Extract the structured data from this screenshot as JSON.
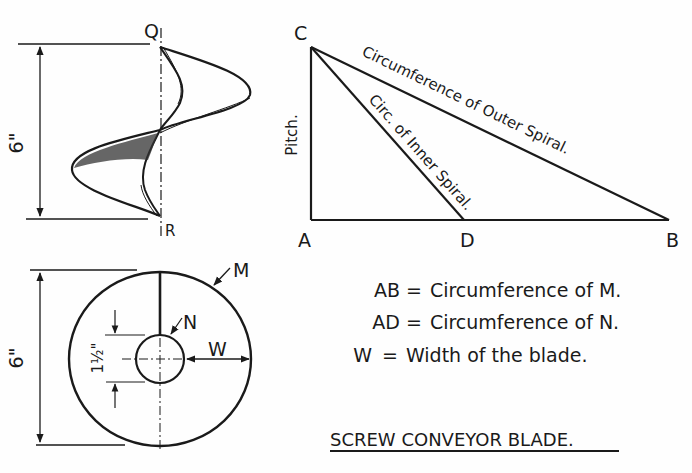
{
  "side_view": {
    "top_point": "Q",
    "bottom_point": "R",
    "height_dim": "6\""
  },
  "triangle": {
    "vertices": {
      "C": "C",
      "A": "A",
      "D": "D",
      "B": "B"
    },
    "side_label": "Pitch.",
    "hypotenuse_outer": "Circumference of Outer Spiral.",
    "hypotenuse_inner": "Circ. of Inner Spiral."
  },
  "end_view": {
    "outer_label": "M",
    "inner_label": "N",
    "width_label": "W",
    "outer_dim": "6\"",
    "inner_dim": "1½\""
  },
  "legend": [
    {
      "lhs": "AB",
      "eq": "=",
      "rhs": "Circumference  of  M."
    },
    {
      "lhs": "AD",
      "eq": "=",
      "rhs": "Circumference  of  N."
    },
    {
      "lhs": "W",
      "eq": "=",
      "rhs": "Width of the blade."
    }
  ],
  "title": "SCREW CONVEYOR BLADE."
}
